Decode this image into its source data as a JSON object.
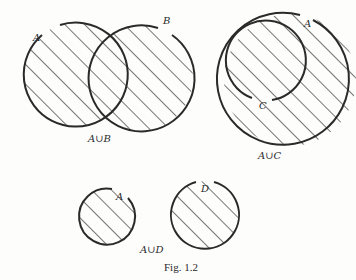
{
  "figure": {
    "caption": "Fig. 1.2",
    "diagrams": [
      {
        "id": "union-a-b",
        "expression": "A∪B",
        "sets": [
          {
            "label": "A"
          },
          {
            "label": "B"
          }
        ],
        "relation": "overlapping"
      },
      {
        "id": "union-a-c",
        "expression": "A∪C",
        "sets": [
          {
            "label": "A"
          },
          {
            "label": "C"
          }
        ],
        "relation": "C subset of A"
      },
      {
        "id": "union-a-d",
        "expression": "A∪D",
        "sets": [
          {
            "label": "A"
          },
          {
            "label": "D"
          }
        ],
        "relation": "disjoint"
      }
    ]
  },
  "style": {
    "stroke": "#2a2a2a",
    "hatch": "#2a2a2a",
    "background": "#fdfdfc"
  }
}
